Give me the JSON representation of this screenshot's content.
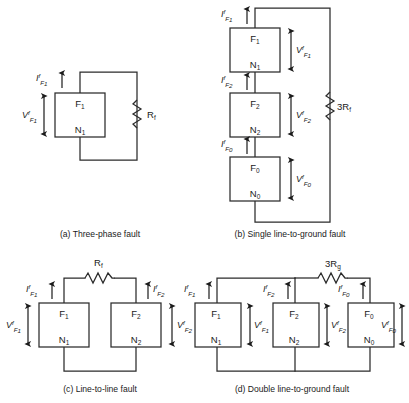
{
  "figure": {
    "background_color": "#ffffff",
    "line_color": "#2b2b2b"
  },
  "panels": [
    {
      "id": "a",
      "caption": "(a) Three-phase fault",
      "fault_type": "three-phase",
      "networks": [
        {
          "top_label": "F",
          "top_sub": "1",
          "bottom_label": "N",
          "bottom_sub": "1"
        }
      ],
      "currents": [
        {
          "symbol": "I",
          "sup": "f",
          "sub": "F",
          "sub2": "1",
          "direction": "up"
        }
      ],
      "voltages": [
        {
          "symbol": "V",
          "sup": "f",
          "sub": "F",
          "sub2": "1",
          "side": "left"
        }
      ],
      "resistor": {
        "label": "R",
        "sub": "f",
        "orientation": "vertical"
      }
    },
    {
      "id": "b",
      "caption": "(b) Single line-to-ground fault",
      "fault_type": "single-line-to-ground",
      "networks": [
        {
          "top_label": "F",
          "top_sub": "1",
          "bottom_label": "N",
          "bottom_sub": "1"
        },
        {
          "top_label": "F",
          "top_sub": "2",
          "bottom_label": "N",
          "bottom_sub": "2"
        },
        {
          "top_label": "F",
          "top_sub": "0",
          "bottom_label": "N",
          "bottom_sub": "0"
        }
      ],
      "currents": [
        {
          "symbol": "I",
          "sup": "f",
          "sub": "F",
          "sub2": "1",
          "direction": "up"
        },
        {
          "symbol": "I",
          "sup": "f",
          "sub": "F",
          "sub2": "2",
          "direction": "up"
        },
        {
          "symbol": "I",
          "sup": "f",
          "sub": "F",
          "sub2": "0",
          "direction": "up"
        }
      ],
      "voltages": [
        {
          "symbol": "V",
          "sup": "f",
          "sub": "F",
          "sub2": "1",
          "side": "right"
        },
        {
          "symbol": "V",
          "sup": "f",
          "sub": "F",
          "sub2": "2",
          "side": "right"
        },
        {
          "symbol": "V",
          "sup": "f",
          "sub": "F",
          "sub2": "0",
          "side": "right"
        }
      ],
      "resistor": {
        "label": "3R",
        "sub": "f",
        "orientation": "vertical"
      }
    },
    {
      "id": "c",
      "caption": "(c) Line-to-line fault",
      "fault_type": "line-to-line",
      "networks": [
        {
          "top_label": "F",
          "top_sub": "1",
          "bottom_label": "N",
          "bottom_sub": "1"
        },
        {
          "top_label": "F",
          "top_sub": "2",
          "bottom_label": "N",
          "bottom_sub": "2"
        }
      ],
      "currents": [
        {
          "symbol": "I",
          "sup": "f",
          "sub": "F",
          "sub2": "1",
          "direction": "up"
        },
        {
          "symbol": "I",
          "sup": "f",
          "sub": "F",
          "sub2": "2",
          "direction": "up"
        }
      ],
      "voltages": [
        {
          "symbol": "V",
          "sup": "f",
          "sub": "F",
          "sub2": "1",
          "side": "left"
        },
        {
          "symbol": "V",
          "sup": "f",
          "sub": "F",
          "sub2": "2",
          "side": "right"
        }
      ],
      "resistor": {
        "label": "R",
        "sub": "f",
        "orientation": "horizontal"
      }
    },
    {
      "id": "d",
      "caption": "(d) Double line-to-ground fault",
      "fault_type": "double-line-to-ground",
      "networks": [
        {
          "top_label": "F",
          "top_sub": "1",
          "bottom_label": "N",
          "bottom_sub": "1"
        },
        {
          "top_label": "F",
          "top_sub": "2",
          "bottom_label": "N",
          "bottom_sub": "2"
        },
        {
          "top_label": "F",
          "top_sub": "0",
          "bottom_label": "N",
          "bottom_sub": "0"
        }
      ],
      "currents": [
        {
          "symbol": "I",
          "sup": "f",
          "sub": "F",
          "sub2": "1",
          "direction": "up"
        },
        {
          "symbol": "I",
          "sup": "f",
          "sub": "F",
          "sub2": "2",
          "direction": "up"
        },
        {
          "symbol": "I",
          "sup": "f",
          "sub": "F",
          "sub2": "0",
          "direction": "up"
        }
      ],
      "voltages": [
        {
          "symbol": "V",
          "sup": "f",
          "sub": "F",
          "sub2": "1",
          "side": "right"
        },
        {
          "symbol": "V",
          "sup": "f",
          "sub": "F",
          "sub2": "2",
          "side": "right"
        },
        {
          "symbol": "V",
          "sup": "f",
          "sub": "F",
          "sub2": "0",
          "side": "right"
        }
      ],
      "resistor": {
        "label": "3R",
        "sub": "g",
        "orientation": "horizontal"
      }
    }
  ],
  "labels": {
    "panel_a": {
      "box1_top": "F",
      "box1_top_sub": "1",
      "box1_bot": "N",
      "box1_bot_sub": "1",
      "current1": "I",
      "current1_sup": "f",
      "current1_sub": "F",
      "current1_sub2": "1",
      "voltage1": "V",
      "voltage1_sup": "f",
      "voltage1_sub": "F",
      "voltage1_sub2": "1",
      "resistor": "R",
      "resistor_sub": "f",
      "caption": "(a) Three-phase fault"
    },
    "panel_b": {
      "box1_top": "F",
      "box1_top_sub": "1",
      "box1_bot": "N",
      "box1_bot_sub": "1",
      "box2_top": "F",
      "box2_top_sub": "2",
      "box2_bot": "N",
      "box2_bot_sub": "2",
      "box3_top": "F",
      "box3_top_sub": "0",
      "box3_bot": "N",
      "box3_bot_sub": "0",
      "current1_sub2": "1",
      "current2_sub2": "2",
      "current3_sub2": "0",
      "voltage1_sub2": "1",
      "voltage2_sub2": "2",
      "voltage3_sub2": "0",
      "resistor": "3R",
      "resistor_sub": "f",
      "caption": "(b) Single line-to-ground fault"
    },
    "panel_c": {
      "box1_top": "F",
      "box1_top_sub": "1",
      "box1_bot": "N",
      "box1_bot_sub": "1",
      "box2_top": "F",
      "box2_top_sub": "2",
      "box2_bot": "N",
      "box2_bot_sub": "2",
      "current1_sub2": "1",
      "current2_sub2": "2",
      "voltage1_sub2": "1",
      "voltage2_sub2": "2",
      "resistor": "R",
      "resistor_sub": "f",
      "caption": "(c) Line-to-line fault"
    },
    "panel_d": {
      "box1_top": "F",
      "box1_top_sub": "1",
      "box1_bot": "N",
      "box1_bot_sub": "1",
      "box2_top": "F",
      "box2_top_sub": "2",
      "box2_bot": "N",
      "box2_bot_sub": "2",
      "box3_top": "F",
      "box3_top_sub": "0",
      "box3_bot": "N",
      "box3_bot_sub": "0",
      "current1_sub2": "1",
      "current2_sub2": "2",
      "current3_sub2": "0",
      "voltage1_sub2": "1",
      "voltage2_sub2": "2",
      "voltage3_sub2": "0",
      "resistor": "3R",
      "resistor_sub": "g",
      "caption": "(d) Double line-to-ground fault"
    },
    "common": {
      "I": "I",
      "V": "V",
      "sup_f": "f",
      "sub_F": "F"
    }
  }
}
